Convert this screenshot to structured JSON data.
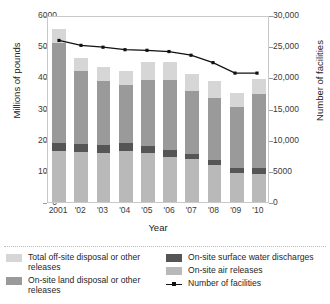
{
  "chart_data": {
    "type": "bar",
    "subtype": "stacked-bar-with-line",
    "title": "",
    "xlabel": "Year",
    "ylabel": "Millions of pounds",
    "ylabel_right": "Number of facilities",
    "categories": [
      "2001",
      "'02",
      "'03",
      "'04",
      "'05",
      "'06",
      "'07",
      "'08",
      "'09",
      "'10"
    ],
    "ylim": [
      0,
      6000
    ],
    "ylim_right": [
      0,
      30000
    ],
    "yticks": [
      "0",
      "1000",
      "2000",
      "3000",
      "4000",
      "5000",
      "6000"
    ],
    "ytick_values": [
      0,
      1000,
      2000,
      3000,
      4000,
      5000,
      6000
    ],
    "yticks_right": [
      "0",
      "5000",
      "10,000",
      "15,000",
      "20,000",
      "25,000",
      "30,000"
    ],
    "ytick_values_right": [
      0,
      5000,
      10000,
      15000,
      20000,
      25000,
      30000
    ],
    "grid": false,
    "legend_position": "bottom",
    "series": [
      {
        "name": "On-site air releases",
        "color": "#b9b9b9",
        "order": 1,
        "values": [
          1630,
          1600,
          1570,
          1640,
          1560,
          1430,
          1380,
          1180,
          930,
          890
        ]
      },
      {
        "name": "On-site surface water discharges",
        "color": "#555555",
        "order": 2,
        "values": [
          250,
          260,
          260,
          240,
          250,
          240,
          170,
          180,
          160,
          200
        ]
      },
      {
        "name": "On-site land disposal or other releases",
        "color": "#9a9a9a",
        "order": 3,
        "values": [
          3230,
          2340,
          2060,
          1880,
          2120,
          2250,
          2010,
          1970,
          1950,
          2370
        ]
      },
      {
        "name": "Total off-site disposal or other releases",
        "color": "#d6d6d6",
        "order": 4,
        "values": [
          450,
          430,
          450,
          460,
          570,
          580,
          560,
          560,
          460,
          490
        ]
      }
    ],
    "totals": [
      5560,
      4630,
      4340,
      4220,
      4500,
      4500,
      4120,
      3890,
      3500,
      3950
    ],
    "line_series": {
      "name": "Number of facilities",
      "color": "#111111",
      "axis": "right",
      "values": [
        26200,
        25400,
        25100,
        24700,
        24600,
        24400,
        23800,
        22600,
        20900,
        20900
      ]
    }
  },
  "axes": {
    "left_title": "Millions of pounds",
    "right_title": "Number of facilities",
    "x_title": "Year"
  },
  "legend": {
    "column1": [
      {
        "label": "Total off-site disposal or other releases",
        "swatch": "#d6d6d6",
        "type": "swatch"
      },
      {
        "label": "On-site land disposal or other releases",
        "swatch": "#9a9a9a",
        "type": "swatch"
      }
    ],
    "column2": [
      {
        "label": "On-site surface water discharges",
        "swatch": "#555555",
        "type": "swatch"
      },
      {
        "label": "On-site air releases",
        "swatch": "#b9b9b9",
        "type": "swatch"
      },
      {
        "label": "Number of facilities",
        "swatch": "#111111",
        "type": "line"
      }
    ]
  }
}
